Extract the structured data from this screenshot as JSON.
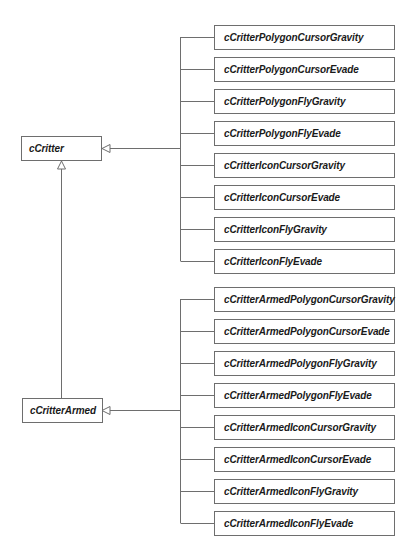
{
  "diagram": {
    "type": "uml-class-inheritance",
    "colors": {
      "line": "#6e6e6e",
      "box_border": "#6e6e6e",
      "text": "#1a1a1a",
      "background": "#ffffff"
    },
    "base_classes": [
      {
        "name": "cCritter"
      },
      {
        "name": "cCritterArmed",
        "parent": "cCritter"
      }
    ],
    "critter_children": [
      {
        "name": "cCritterPolygonCursorGravity"
      },
      {
        "name": "cCritterPolygonCursorEvade"
      },
      {
        "name": "cCritterPolygonFlyGravity"
      },
      {
        "name": "cCritterPolygonFlyEvade"
      },
      {
        "name": "cCritterIconCursorGravity"
      },
      {
        "name": "cCritterIconCursorEvade"
      },
      {
        "name": "cCritterIconFlyGravity"
      },
      {
        "name": "cCritterIconFlyEvade"
      }
    ],
    "armed_children": [
      {
        "name": "cCritterArmedPolygonCursorGravity"
      },
      {
        "name": "cCritterArmedPolygonCursorEvade"
      },
      {
        "name": "cCritterArmedPolygonFlyGravity"
      },
      {
        "name": "cCritterArmedPolygonFlyEvade"
      },
      {
        "name": "cCritterArmedIconCursorGravity"
      },
      {
        "name": "cCritterArmedIconCursorEvade"
      },
      {
        "name": "cCritterArmedIconFlyGravity"
      },
      {
        "name": "cCritterArmedIconFlyEvade"
      }
    ]
  }
}
